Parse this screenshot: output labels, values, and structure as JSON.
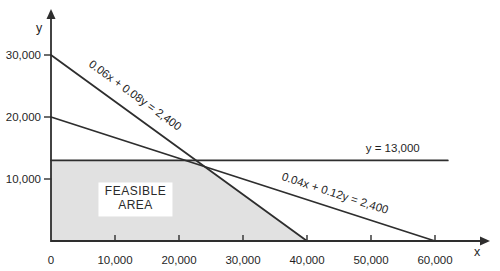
{
  "chart_data": {
    "type": "line",
    "title": "",
    "xlabel": "x",
    "ylabel": "y",
    "xlim": [
      0,
      63000
    ],
    "ylim": [
      0,
      33000
    ],
    "grid": false,
    "x_ticks": [
      {
        "value": 0,
        "label": "0"
      },
      {
        "value": 10000,
        "label": "10,000"
      },
      {
        "value": 20000,
        "label": "20,000"
      },
      {
        "value": 30000,
        "label": "30,000"
      },
      {
        "value": 40000,
        "label": "40,000"
      },
      {
        "value": 50000,
        "label": "50,000"
      },
      {
        "value": 60000,
        "label": "60,000"
      }
    ],
    "y_ticks": [
      {
        "value": 10000,
        "label": "10,000"
      },
      {
        "value": 20000,
        "label": "20,000"
      },
      {
        "value": 30000,
        "label": "30,000"
      }
    ],
    "lines": [
      {
        "name": "constraint-1",
        "label": "0.06x + 0.08y = 2,400",
        "points": [
          [
            0,
            30000
          ],
          [
            40000,
            0
          ]
        ],
        "label_pos": [
          12800,
          23000
        ],
        "rotate_label": true
      },
      {
        "name": "constraint-2",
        "label": "0.04x + 0.12y = 2,400",
        "points": [
          [
            0,
            20000
          ],
          [
            60000,
            0
          ]
        ],
        "label_pos": [
          44200,
          7100
        ],
        "rotate_label": true
      },
      {
        "name": "y-equals-13000",
        "label": "y = 13,000",
        "points": [
          [
            0,
            13000
          ],
          [
            62000,
            13000
          ]
        ],
        "label_pos": [
          53400,
          14300
        ],
        "rotate_label": false
      }
    ],
    "region": {
      "name": "feasible-area",
      "label_lines": [
        "FEASIBLE",
        "AREA"
      ],
      "vertices": [
        [
          0,
          13000
        ],
        [
          22667,
          13000
        ],
        [
          40000,
          0
        ],
        [
          0,
          0
        ]
      ],
      "label_pos": [
        13200,
        6700
      ]
    },
    "colors": {
      "line": "#2e2e2e",
      "axis": "#2e2e2e",
      "region_fill": "#e1e1e1",
      "label_box_fill": "#ffffff",
      "text": "#1f1f1f",
      "background": "#ffffff"
    }
  }
}
